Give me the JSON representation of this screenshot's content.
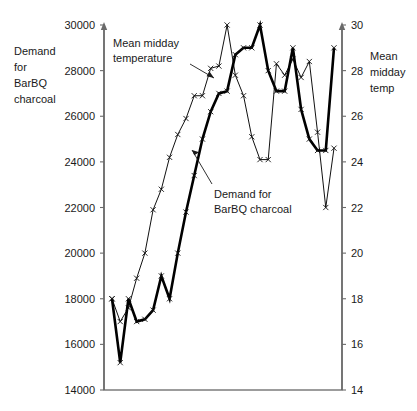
{
  "chart_data": {
    "type": "line",
    "title": "",
    "subtitle": "",
    "xlabel": "",
    "ylabel": "Demand for BarBQ charcoal",
    "grid": false,
    "legend_position": "inline-annotations",
    "x": [
      1,
      2,
      3,
      4,
      5,
      6,
      7,
      8,
      9,
      10,
      11,
      12,
      13,
      14,
      15,
      16,
      17,
      18,
      19,
      20,
      21,
      22,
      23,
      24,
      25,
      26,
      27,
      28
    ],
    "axes": {
      "left": {
        "label_lines": [
          "Demand",
          "for",
          "BarBQ",
          "charcoal"
        ],
        "ticks": [
          14000,
          16000,
          18000,
          20000,
          22000,
          24000,
          26000,
          28000,
          30000
        ],
        "tick_labels": [
          "14000",
          "16000",
          "18000",
          "20000",
          "22000",
          "24000",
          "26000",
          "28000",
          "30000"
        ],
        "ylim": [
          14000,
          30000
        ]
      },
      "right": {
        "label_lines": [
          "Mean",
          "midday",
          "temp"
        ],
        "ticks": [
          14,
          16,
          18,
          20,
          22,
          24,
          26,
          28,
          30
        ],
        "tick_labels": [
          "14",
          "16",
          "18",
          "20",
          "22",
          "24",
          "26",
          "28",
          "30"
        ],
        "ylim": [
          14,
          30
        ]
      }
    },
    "series": [
      {
        "name": "Mean midday temperature",
        "axis": "right",
        "style": "thin",
        "marker": "x",
        "annotation": "Mean midday temperature",
        "values": [
          18.0,
          17.0,
          17.6,
          18.9,
          20.0,
          21.9,
          22.8,
          24.2,
          25.2,
          25.9,
          26.9,
          26.9,
          28.1,
          28.2,
          30.0,
          27.8,
          26.9,
          25.1,
          24.1,
          24.1,
          28.3,
          27.8,
          28.5,
          27.7,
          28.4,
          25.3,
          22.0,
          24.6
        ]
      },
      {
        "name": "Demand for BarBQ charcoal",
        "axis": "left",
        "style": "thick",
        "marker": "x",
        "annotation": "Demand for BarBQ charcoal",
        "values": [
          18000,
          15200,
          18000,
          17000,
          17100,
          17500,
          19000,
          18000,
          20000,
          21800,
          23400,
          25000,
          26200,
          27000,
          27100,
          28700,
          29000,
          29000,
          30000,
          28000,
          27100,
          27100,
          29000,
          26300,
          25000,
          24500,
          24500,
          29000
        ]
      }
    ],
    "annotations": [
      {
        "id": "temp-annotation",
        "text_lines": [
          "Mean midday",
          "temperature"
        ],
        "target_series": "Mean midday temperature"
      },
      {
        "id": "demand-annotation",
        "text_lines": [
          "Demand for",
          "BarBQ charcoal"
        ],
        "target_series": "Demand for BarBQ charcoal"
      }
    ],
    "colors": {
      "line": "#111111",
      "axis": "#6a6a6a",
      "text": "#1a1a1a",
      "background": "#ffffff"
    }
  }
}
